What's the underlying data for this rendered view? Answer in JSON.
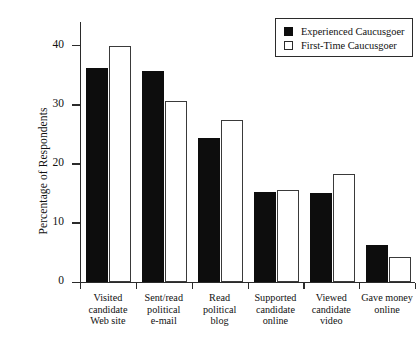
{
  "chart_data": {
    "type": "bar",
    "title": "",
    "subtitle": "",
    "xlabel": "",
    "ylabel": "Percentage of Respondents",
    "ylim": [
      0,
      44
    ],
    "yticks": [
      0,
      10,
      20,
      30,
      40
    ],
    "ytick_labels": [
      "0",
      "10",
      "20",
      "30",
      "40"
    ],
    "grid": false,
    "legend_position": "top-right",
    "categories": [
      "Visited candidate Web site",
      "Sent/read political e-mail",
      "Read political blog",
      "Supported candidate online",
      "Viewed candidate video",
      "Gave money online"
    ],
    "category_lines": [
      [
        "Visited",
        "candidate",
        "Web site"
      ],
      [
        "Sent/read",
        "political",
        "e-mail"
      ],
      [
        "Read",
        "political",
        "blog"
      ],
      [
        "Supported",
        "candidate",
        "online"
      ],
      [
        "Viewed",
        "candidate",
        "video"
      ],
      [
        "Gave money",
        "online"
      ]
    ],
    "series": [
      {
        "name": "Experienced Caucusgoer",
        "color": "#0d0d0d",
        "fill": "solid",
        "values": [
          36.2,
          35.7,
          24.3,
          15.2,
          15.0,
          6.3
        ]
      },
      {
        "name": "First-Time Caucusgoer",
        "color": "#ffffff",
        "fill": "hollow",
        "values": [
          40.0,
          30.6,
          27.4,
          15.5,
          18.2,
          4.2
        ]
      }
    ]
  },
  "legend": {
    "entries": [
      {
        "label": "Experienced Caucusgoer",
        "swatch": "filled-square"
      },
      {
        "label": "First-Time Caucusgoer",
        "swatch": "hollow-square"
      }
    ]
  },
  "axes": {
    "y_title": "Percentage of Respondents"
  }
}
